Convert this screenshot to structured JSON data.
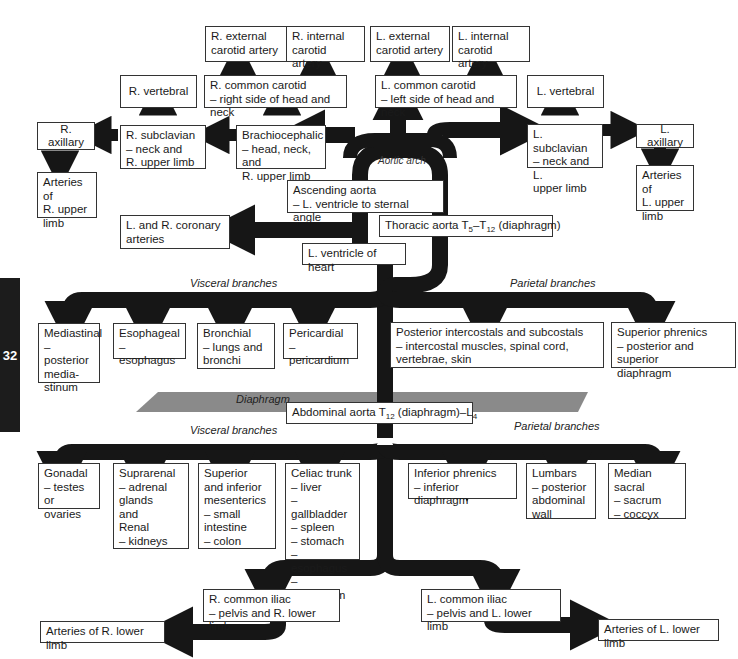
{
  "page_tab": "32",
  "labels": {
    "aortic_arch": "Aortic arch",
    "thoracic_visceral": "Visceral branches",
    "thoracic_parietal": "Parietal branches",
    "diaphragm": "Diaphragm",
    "abdominal_visceral": "Visceral branches",
    "abdominal_parietal": "Parietal branches"
  },
  "boxes": {
    "r_ext_carotid": "R. external\ncarotid artery",
    "r_int_carotid": "R. internal\ncarotid artery",
    "l_ext_carotid": "L. external\ncarotid artery",
    "l_int_carotid": "L. internal\ncarotid artery",
    "r_vertebral": "R. vertebral",
    "r_common_carotid": "R. common carotid\n– right side of head and neck",
    "l_common_carotid": "L. common carotid\n– left side of head and neck",
    "l_vertebral": "L. vertebral",
    "r_axillary": "R. axillary",
    "r_subclavian": "R. subclavian\n– neck and\n   R. upper limb",
    "brachiocephalic": "Brachiocephalic\n– head, neck, and\n   R. upper limb",
    "l_subclavian": "L. subclavian\n– neck and L.\n   upper limb",
    "l_axillary": "L. axillary",
    "r_upper_limb_arteries": "Arteries of\nR. upper\nlimb",
    "l_upper_limb_arteries": "Arteries of\nL. upper\nlimb",
    "ascending_aorta": "Ascending aorta\n– L. ventricle to sternal angle",
    "coronary": "L. and R. coronary\narteries",
    "thoracic_aorta_pre": "Thoracic aorta T",
    "thoracic_aorta_sub1": "5",
    "thoracic_aorta_mid": "–T",
    "thoracic_aorta_sub2": "12",
    "thoracic_aorta_post": " (diaphragm)",
    "l_ventricle": "L. ventricle of heart",
    "mediastinal": "Mediastinal\n– posterior\n   media-\n   stinum",
    "esophageal": "Esophageal\n– esophagus",
    "bronchial": "Bronchial\n– lungs and\n   bronchi",
    "pericardial": "Pericardial\n– pericardium",
    "posterior_intercostals": "Posterior intercostals and subcostals\n– intercostal muscles, spinal cord,\n   vertebrae, skin",
    "superior_phrenics": "Superior phrenics\n– posterior and superior\n   diaphragm",
    "abdominal_aorta_pre": "Abdominal aorta T",
    "abdominal_aorta_sub1": "12",
    "abdominal_aorta_mid": " (diaphragm)–L",
    "abdominal_aorta_sub2": "4",
    "gonadal": "Gonadal\n– testes or\n   ovaries",
    "suprarenal": "Suprarenal\n– adrenal\n   glands\n   and\nRenal\n– kidneys",
    "mesenterics": "Superior\nand inferior\nmesenterics\n– small\n   intestine\n– colon",
    "celiac": "Celiac trunk\n– liver\n– gallbladder\n– spleen\n– stomach\n– esophagus\n– duodenum",
    "inferior_phrenics": "Inferior phrenics\n– inferior diaphragm",
    "lumbars": "Lumbars\n– posterior\n   abdominal\n   wall",
    "median_sacral": "Median sacral\n– sacrum\n– coccyx",
    "r_common_iliac": "R. common iliac\n– pelvis and R. lower limb",
    "l_common_iliac": "L. common iliac\n– pelvis and L. lower limb",
    "r_lower_limb_arteries": "Arteries of R. lower limb",
    "l_lower_limb_arteries": "Arteries of L. lower limb"
  },
  "colors": {
    "vessel": "#161616",
    "diaphragm": "#8a8a8a",
    "box_border": "#333333",
    "tab": "#1c1c1c"
  }
}
